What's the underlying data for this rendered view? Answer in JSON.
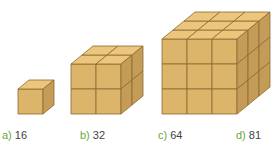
{
  "figure": {
    "cubes": [
      {
        "id": "a",
        "grid": 1
      },
      {
        "id": "b",
        "grid": 2
      },
      {
        "id": "c",
        "grid": 3
      }
    ],
    "colors": {
      "front": "#dcb46a",
      "top": "#ecc67c",
      "side": "#c49c58",
      "edge": "#8a6a34",
      "option_letter": "#6aa83a",
      "option_value": "#444444"
    }
  },
  "options": [
    {
      "letter": "a)",
      "value": "16"
    },
    {
      "letter": "b)",
      "value": "32"
    },
    {
      "letter": "c)",
      "value": "64"
    },
    {
      "letter": "d)",
      "value": "81"
    }
  ]
}
